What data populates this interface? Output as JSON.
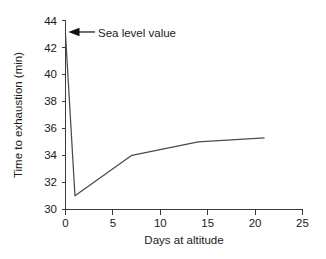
{
  "chart_data": {
    "type": "line",
    "title": "",
    "xlabel": "Days at altitude",
    "ylabel": "Time to exhaustion (min)",
    "xlim": [
      0,
      25
    ],
    "ylim": [
      30,
      44
    ],
    "xticks": [
      0,
      5,
      10,
      15,
      20,
      25
    ],
    "yticks": [
      30,
      32,
      34,
      36,
      38,
      40,
      42,
      44
    ],
    "xtick_labels": [
      "0",
      "5",
      "10",
      "15",
      "20",
      "25"
    ],
    "ytick_labels": [
      "30",
      "32",
      "34",
      "36",
      "38",
      "40",
      "42",
      "44"
    ],
    "grid": false,
    "legend": false,
    "series": [
      {
        "name": "Time to exhaustion",
        "x": [
          0,
          1,
          7,
          14,
          21
        ],
        "values": [
          43.0,
          31.0,
          34.0,
          35.0,
          35.3
        ],
        "color": "#4a4a4a"
      }
    ],
    "annotations": [
      {
        "text": "Sea level value",
        "points_to_x": 0,
        "points_to_y": 43.0,
        "arrow": "left-arrow-icon"
      }
    ]
  },
  "axes": {
    "y_title": "Time to exhaustion (min)",
    "x_title": "Days at altitude"
  },
  "annotation": {
    "label": "Sea level value"
  }
}
